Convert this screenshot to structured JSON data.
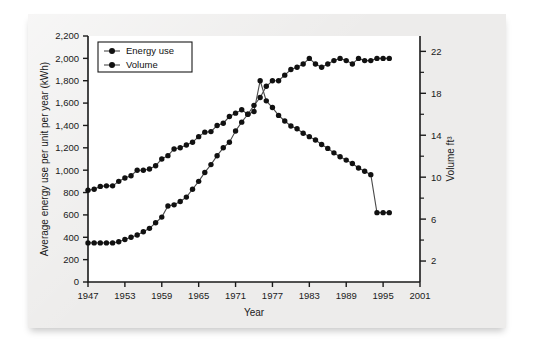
{
  "figure": {
    "background_color": "#edeceb",
    "plot_background_color": "#ffffff",
    "series_color": "#111111"
  },
  "chart_data": {
    "type": "line",
    "title": "",
    "xlabel": "Year",
    "ylabel": "Average energy use per unit per year (kWh)",
    "y2label": "Volume ft³",
    "xlim": [
      1947,
      2001
    ],
    "ylim": [
      0,
      2200
    ],
    "y2lim": [
      0,
      23.466
    ],
    "xticks": [
      1947,
      1953,
      1959,
      1965,
      1971,
      1977,
      1983,
      1989,
      1995,
      2001
    ],
    "yticks": [
      0,
      200,
      400,
      600,
      800,
      1000,
      1200,
      1400,
      1600,
      1800,
      2000,
      2200
    ],
    "ytick_labels": [
      "0",
      "200",
      "400",
      "600",
      "800",
      "1,000",
      "1,200",
      "1,400",
      "1,600",
      "1,800",
      "2,000",
      "2,200"
    ],
    "y2ticks": [
      2,
      6,
      10,
      14,
      18,
      22
    ],
    "y2ticks_minor": [
      4,
      8,
      12,
      16,
      20
    ],
    "grid": false,
    "legend_position": "top-left",
    "legend": [
      "Energy use",
      "Volume"
    ],
    "series": [
      {
        "name": "Energy use",
        "axis": "left",
        "unit": "kWh",
        "x": [
          1947,
          1948,
          1949,
          1950,
          1951,
          1952,
          1953,
          1954,
          1955,
          1956,
          1957,
          1958,
          1959,
          1960,
          1961,
          1962,
          1963,
          1964,
          1965,
          1966,
          1967,
          1968,
          1969,
          1970,
          1971,
          1972,
          1973,
          1974,
          1975,
          1976,
          1977,
          1978,
          1979,
          1980,
          1981,
          1982,
          1983,
          1984,
          1985,
          1986,
          1987,
          1988,
          1989,
          1990,
          1991,
          1992,
          1993,
          1994,
          1995,
          1996
        ],
        "values": [
          820,
          830,
          855,
          860,
          860,
          900,
          930,
          950,
          1000,
          1000,
          1010,
          1040,
          1100,
          1130,
          1190,
          1200,
          1225,
          1250,
          1300,
          1340,
          1345,
          1400,
          1420,
          1480,
          1510,
          1540,
          1500,
          1525,
          1800,
          1620,
          1560,
          1490,
          1440,
          1395,
          1370,
          1330,
          1300,
          1270,
          1230,
          1195,
          1155,
          1120,
          1090,
          1060,
          1020,
          990,
          960,
          620,
          620,
          620
        ]
      },
      {
        "name": "Volume",
        "axis": "right",
        "unit": "ft³",
        "x": [
          1947,
          1948,
          1949,
          1950,
          1951,
          1952,
          1953,
          1954,
          1955,
          1956,
          1957,
          1958,
          1959,
          1960,
          1961,
          1962,
          1963,
          1964,
          1965,
          1966,
          1967,
          1968,
          1969,
          1970,
          1971,
          1972,
          1973,
          1974,
          1975,
          1976,
          1977,
          1978,
          1979,
          1980,
          1981,
          1982,
          1983,
          1984,
          1985,
          1986,
          1987,
          1988,
          1989,
          1990,
          1991,
          1992,
          1993,
          1994,
          1995,
          1996
        ],
        "values": [
          3.73,
          3.73,
          3.73,
          3.73,
          3.73,
          3.84,
          4.05,
          4.27,
          4.48,
          4.8,
          5.12,
          5.65,
          6.19,
          7.25,
          7.36,
          7.68,
          8.1,
          8.85,
          9.6,
          10.45,
          11.2,
          12.05,
          12.8,
          13.33,
          14.4,
          15.25,
          16,
          16.85,
          17.6,
          18.67,
          19.2,
          19.2,
          19.73,
          20.27,
          20.48,
          20.8,
          21.33,
          20.8,
          20.48,
          20.8,
          21.12,
          21.33,
          21.12,
          20.8,
          21.33,
          21.12,
          21.12,
          21.33,
          21.33,
          21.33
        ]
      }
    ]
  }
}
